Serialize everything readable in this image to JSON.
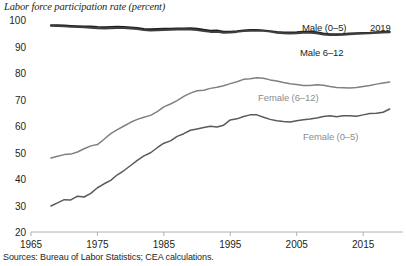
{
  "chart_data": {
    "type": "line",
    "title": "Labor force participation rate (percent)",
    "xlabel": "",
    "ylabel": "",
    "ylim": [
      20,
      100
    ],
    "xlim": [
      1965,
      2021
    ],
    "grid": false,
    "legend_position": "inline-annotations",
    "y_ticks": [
      100,
      90,
      80,
      70,
      60,
      50,
      40,
      30,
      20
    ],
    "x_ticks": [
      1965,
      1975,
      1985,
      1995,
      2005,
      2015
    ],
    "source_note": "Sources: Bureau of Labor Statistics; CEA calculations.",
    "end_year_annotation": "2019",
    "colors": {
      "male_0_5": "#231f20",
      "male_6_12": "#3f3f3f",
      "female_6_12": "#808080",
      "female_0_5": "#5a5a5a",
      "axis": "#b0b0b0",
      "text": "#231f20",
      "muted_text": "#8d8d8d"
    },
    "series": [
      {
        "name": "Male (0–5)",
        "label": "Male (0–5)",
        "color": "#231f20",
        "x": [
          1968,
          1969,
          1970,
          1971,
          1972,
          1973,
          1974,
          1975,
          1976,
          1977,
          1978,
          1979,
          1980,
          1981,
          1982,
          1983,
          1984,
          1985,
          1986,
          1987,
          1988,
          1989,
          1990,
          1991,
          1992,
          1993,
          1994,
          1995,
          1996,
          1997,
          1998,
          1999,
          2000,
          2001,
          2002,
          2003,
          2004,
          2005,
          2006,
          2007,
          2008,
          2009,
          2010,
          2011,
          2012,
          2013,
          2014,
          2015,
          2016,
          2017,
          2018,
          2019
        ],
        "values": [
          98.0,
          98.0,
          97.9,
          97.8,
          97.7,
          97.6,
          97.6,
          97.4,
          97.3,
          97.4,
          97.5,
          97.4,
          97.2,
          97.0,
          96.6,
          96.5,
          96.6,
          96.7,
          96.7,
          96.8,
          96.8,
          96.9,
          96.7,
          96.3,
          96.0,
          96.1,
          95.6,
          95.6,
          95.8,
          96.1,
          96.2,
          96.2,
          96.1,
          95.8,
          95.5,
          95.3,
          95.3,
          95.4,
          95.6,
          95.6,
          95.4,
          94.9,
          94.6,
          94.6,
          94.7,
          94.9,
          95.0,
          95.1,
          95.2,
          95.4,
          95.5,
          95.6
        ]
      },
      {
        "name": "Male 6–12",
        "label": "Male 6–12",
        "color": "#3f3f3f",
        "x": [
          1968,
          1969,
          1970,
          1971,
          1972,
          1973,
          1974,
          1975,
          1976,
          1977,
          1978,
          1979,
          1980,
          1981,
          1982,
          1983,
          1984,
          1985,
          1986,
          1987,
          1988,
          1989,
          1990,
          1991,
          1992,
          1993,
          1994,
          1995,
          1996,
          1997,
          1998,
          1999,
          2000,
          2001,
          2002,
          2003,
          2004,
          2005,
          2006,
          2007,
          2008,
          2009,
          2010,
          2011,
          2012,
          2013,
          2014,
          2015,
          2016,
          2017,
          2018,
          2019
        ],
        "values": [
          97.8,
          97.7,
          97.6,
          97.4,
          97.3,
          97.2,
          97.1,
          96.9,
          96.8,
          96.9,
          97.0,
          97.0,
          96.8,
          96.6,
          96.2,
          96.0,
          96.1,
          96.2,
          96.3,
          96.4,
          96.5,
          96.4,
          96.2,
          95.8,
          95.5,
          95.5,
          95.2,
          95.3,
          95.5,
          95.8,
          95.9,
          96.0,
          95.9,
          95.6,
          95.2,
          95.0,
          94.9,
          95.0,
          95.2,
          95.2,
          95.0,
          94.5,
          94.3,
          94.3,
          94.4,
          94.6,
          94.8,
          94.9,
          95.0,
          95.2,
          95.3,
          95.4
        ]
      },
      {
        "name": "Female (6–12)",
        "label": "Female (6–12)",
        "color": "#808080",
        "x": [
          1968,
          1969,
          1970,
          1971,
          1972,
          1973,
          1974,
          1975,
          1976,
          1977,
          1978,
          1979,
          1980,
          1981,
          1982,
          1983,
          1984,
          1985,
          1986,
          1987,
          1988,
          1989,
          1990,
          1991,
          1992,
          1993,
          1994,
          1995,
          1996,
          1997,
          1998,
          1999,
          2000,
          2001,
          2002,
          2003,
          2004,
          2005,
          2006,
          2007,
          2008,
          2009,
          2010,
          2011,
          2012,
          2013,
          2014,
          2015,
          2016,
          2017,
          2018,
          2019
        ],
        "values": [
          47.9,
          48.6,
          49.2,
          49.4,
          50.2,
          51.4,
          52.5,
          53.0,
          55.0,
          57.1,
          58.6,
          60.0,
          61.4,
          62.5,
          63.3,
          64.0,
          65.4,
          67.2,
          68.3,
          69.6,
          71.2,
          72.4,
          73.3,
          73.5,
          74.2,
          74.6,
          75.2,
          76.0,
          76.7,
          77.6,
          77.8,
          78.2,
          78.0,
          77.4,
          77.0,
          76.4,
          75.9,
          75.7,
          75.3,
          75.3,
          75.6,
          75.4,
          74.9,
          74.5,
          74.4,
          74.3,
          74.5,
          74.9,
          75.3,
          75.8,
          76.2,
          76.6
        ]
      },
      {
        "name": "Female (0–5)",
        "label": "Female (0–5)",
        "color": "#5a5a5a",
        "x": [
          1968,
          1969,
          1970,
          1971,
          1972,
          1973,
          1974,
          1975,
          1976,
          1977,
          1978,
          1979,
          1980,
          1981,
          1982,
          1983,
          1984,
          1985,
          1986,
          1987,
          1988,
          1989,
          1990,
          1991,
          1992,
          1993,
          1994,
          1995,
          1996,
          1997,
          1998,
          1999,
          2000,
          2001,
          2002,
          2003,
          2004,
          2005,
          2006,
          2007,
          2008,
          2009,
          2010,
          2011,
          2012,
          2013,
          2014,
          2015,
          2016,
          2017,
          2018,
          2019
        ],
        "values": [
          29.8,
          31.0,
          32.2,
          32.1,
          33.5,
          33.2,
          34.6,
          36.7,
          38.2,
          39.5,
          41.6,
          43.2,
          45.1,
          47.0,
          48.7,
          49.9,
          51.8,
          53.5,
          54.4,
          56.1,
          57.1,
          58.4,
          58.9,
          59.4,
          59.9,
          59.6,
          60.3,
          62.3,
          62.7,
          63.6,
          64.2,
          64.2,
          63.3,
          62.5,
          62.0,
          61.7,
          61.5,
          62.0,
          62.4,
          62.6,
          63.0,
          63.6,
          63.9,
          63.5,
          63.9,
          63.9,
          63.7,
          64.2,
          64.7,
          64.8,
          65.2,
          66.4
        ]
      }
    ],
    "annotations": [
      {
        "text": "Male (0–5)",
        "x_px": 302,
        "y_px": 22,
        "style": "dark"
      },
      {
        "text": "Male 6–12",
        "x_px": 300,
        "y_px": 47,
        "style": "dark"
      },
      {
        "text": "2019",
        "x_px": 370,
        "y_px": 22,
        "style": "dark"
      },
      {
        "text": "Female (6–12)",
        "x_px": 258,
        "y_px": 92,
        "style": "muted"
      },
      {
        "text": "Female (0–5)",
        "x_px": 303,
        "y_px": 131,
        "style": "muted"
      }
    ]
  }
}
